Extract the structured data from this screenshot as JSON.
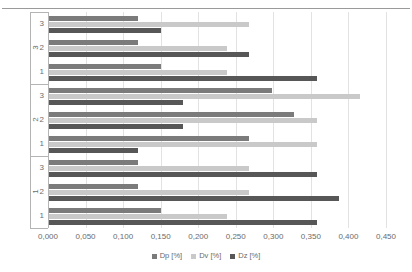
{
  "chart_data": {
    "type": "bar",
    "orientation": "horizontal",
    "title": "",
    "xlabel": "",
    "ylabel": "",
    "xlim": [
      0.0,
      0.45
    ],
    "xticks": [
      "0,000",
      "0,050",
      "0,100",
      "0,150",
      "0,200",
      "0,250",
      "0,300",
      "0,350",
      "0,400",
      "0,450"
    ],
    "xtick_values": [
      0.0,
      0.05,
      0.1,
      0.15,
      0.2,
      0.25,
      0.3,
      0.35,
      0.4,
      0.45
    ],
    "grid": true,
    "legend_position": "bottom",
    "decimal_separator": ",",
    "group_labels": [
      "3",
      "2",
      "1"
    ],
    "subcategories": [
      "3",
      "2",
      "1"
    ],
    "categories": [
      "3-3",
      "3-2",
      "3-1",
      "2-3",
      "2-2",
      "2-1",
      "1-3",
      "1-2",
      "1-1"
    ],
    "series": [
      {
        "name": "Dp [%]",
        "color": "#7b7b7b",
        "values": [
          0.12,
          0.12,
          0.15,
          0.298,
          0.328,
          0.268,
          0.12,
          0.12,
          0.15
        ]
      },
      {
        "name": "Dv [%]",
        "color": "#c9c9c9",
        "values": [
          0.268,
          0.238,
          0.238,
          0.416,
          0.358,
          0.358,
          0.268,
          0.268,
          0.238
        ]
      },
      {
        "name": "Dz [%]",
        "color": "#575757",
        "values": [
          0.15,
          0.268,
          0.358,
          0.18,
          0.18,
          0.12,
          0.358,
          0.388,
          0.358
        ]
      }
    ]
  },
  "legend": {
    "items": [
      {
        "label": "Dp [%]",
        "series": "dp"
      },
      {
        "label": "Dv [%]",
        "series": "dv"
      },
      {
        "label": "Dz [%]",
        "series": "dz"
      }
    ]
  },
  "axis": {
    "x_tick_labels": [
      "0,000",
      "0,050",
      "0,100",
      "0,150",
      "0,200",
      "0,250",
      "0,300",
      "0,350",
      "0,400",
      "0,450"
    ],
    "groups": [
      {
        "label": "3",
        "subcategories": [
          "3",
          "2",
          "1"
        ]
      },
      {
        "label": "2",
        "subcategories": [
          "3",
          "2",
          "1"
        ]
      },
      {
        "label": "1",
        "subcategories": [
          "3",
          "2",
          "1"
        ]
      }
    ]
  }
}
